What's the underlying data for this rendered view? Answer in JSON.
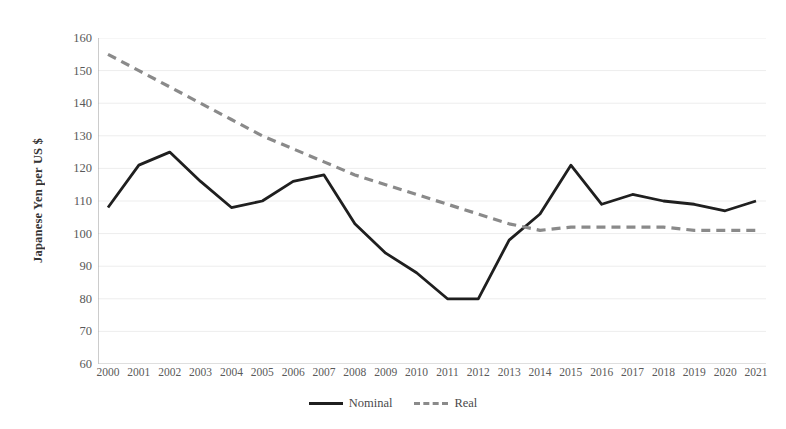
{
  "chart_data": {
    "type": "line",
    "title": "",
    "xlabel": "",
    "ylabel": "Japanese Yen per US $",
    "categories": [
      "2000",
      "2001",
      "2002",
      "2003",
      "2004",
      "2005",
      "2006",
      "2007",
      "2008",
      "2009",
      "2010",
      "2011",
      "2012",
      "2013",
      "2014",
      "2015",
      "2016",
      "2017",
      "2018",
      "2019",
      "2020",
      "2021"
    ],
    "ylim": [
      60,
      160
    ],
    "ytick_step": 10,
    "yticks": [
      60,
      70,
      80,
      90,
      100,
      110,
      120,
      130,
      140,
      150,
      160
    ],
    "grid": true,
    "legend_position": "bottom",
    "series": [
      {
        "name": "Nominal",
        "style": "solid",
        "color": "#1f1f1f",
        "values": [
          108,
          121,
          125,
          116,
          108,
          110,
          116,
          118,
          103,
          94,
          88,
          80,
          80,
          98,
          106,
          121,
          109,
          112,
          110,
          109,
          107,
          110
        ]
      },
      {
        "name": "Real",
        "style": "dashed",
        "color": "#8a8a8a",
        "values": [
          155,
          150,
          145,
          140,
          135,
          130,
          126,
          122,
          118,
          115,
          112,
          109,
          106,
          103,
          101,
          102,
          102,
          102,
          102,
          101,
          101,
          101
        ]
      }
    ]
  },
  "legend": {
    "items": [
      {
        "label": "Nominal"
      },
      {
        "label": "Real"
      }
    ]
  }
}
